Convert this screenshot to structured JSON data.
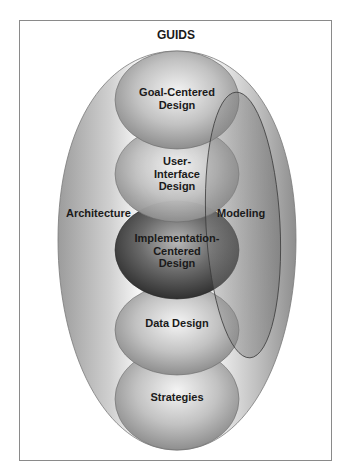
{
  "diagram": {
    "title": "GUIDS",
    "outer_region": {
      "left_label": "Architecture",
      "right_label": "Modeling"
    },
    "spheres": [
      {
        "id": "goal",
        "line1": "Goal-Centered",
        "line2": "Design",
        "line3": ""
      },
      {
        "id": "ui",
        "line1": "User-",
        "line2": "Interface",
        "line3": "Design"
      },
      {
        "id": "impl",
        "line1": "Implementation-",
        "line2": "Centered",
        "line3": "Design"
      },
      {
        "id": "data",
        "line1": "Data Design",
        "line2": "",
        "line3": ""
      },
      {
        "id": "strategies",
        "line1": "Strategies",
        "line2": "",
        "line3": ""
      }
    ],
    "colors": {
      "frame": "#8a8a8a",
      "sphere_light": "#e8e8e8",
      "sphere_mid": "#9a9a9a",
      "sphere_dark": "#3a3a3a",
      "text": "#1a1a1a"
    }
  }
}
